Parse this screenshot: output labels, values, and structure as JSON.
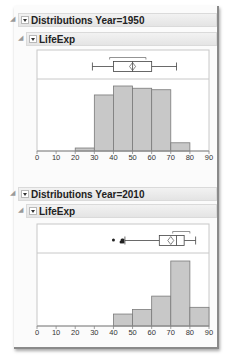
{
  "sections": [
    {
      "title": "Distributions Year=1950",
      "subtitle": "LifeExp"
    },
    {
      "title": "Distributions Year=2010",
      "subtitle": "LifeExp"
    }
  ],
  "colors": {
    "bar_fill": "#c8c8c8",
    "bar_stroke": "#7a7a7a",
    "frame": "#c8c8c8",
    "header_bg": "#e8e8e8"
  },
  "chart_data": [
    {
      "type": "bar",
      "title": "Distributions Year=1950 — LifeExp",
      "xlabel": "",
      "ylabel": "",
      "bins": [
        [
          20,
          30
        ],
        [
          30,
          40
        ],
        [
          40,
          50
        ],
        [
          50,
          60
        ],
        [
          60,
          70
        ],
        [
          70,
          80
        ]
      ],
      "categories": [
        "20-30",
        "30-40",
        "40-50",
        "50-60",
        "60-70",
        "70-80"
      ],
      "values": [
        4,
        75,
        87,
        84,
        82,
        11
      ],
      "xlim": [
        0,
        90
      ],
      "xticks": [
        0,
        10,
        20,
        30,
        40,
        50,
        60,
        70,
        80,
        90
      ],
      "boxplot": {
        "whisker_low": 29,
        "q1": 40,
        "median": 50,
        "q3": 60,
        "whisker_high": 73,
        "mean": 50,
        "shortest_half": [
          38,
          57
        ],
        "outliers": []
      },
      "grid": false
    },
    {
      "type": "bar",
      "title": "Distributions Year=2010 — LifeExp",
      "xlabel": "",
      "ylabel": "",
      "bins": [
        [
          40,
          50
        ],
        [
          50,
          60
        ],
        [
          60,
          70
        ],
        [
          70,
          80
        ],
        [
          80,
          90
        ]
      ],
      "categories": [
        "40-50",
        "50-60",
        "60-70",
        "70-80",
        "80-90"
      ],
      "values": [
        16,
        22,
        40,
        87,
        25
      ],
      "xlim": [
        0,
        90
      ],
      "xticks": [
        0,
        10,
        20,
        30,
        40,
        50,
        60,
        70,
        80,
        90
      ],
      "boxplot": {
        "whisker_low": 46,
        "q1": 64,
        "median": 73,
        "q3": 77,
        "whisker_high": 83,
        "mean": 70,
        "shortest_half": [
          71,
          80
        ],
        "outliers": [
          40,
          44,
          44.5,
          45,
          45
        ]
      },
      "grid": false
    }
  ]
}
